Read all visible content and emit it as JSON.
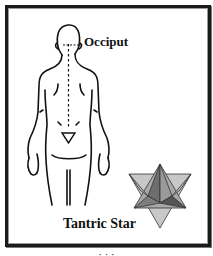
{
  "diagram": {
    "labels": {
      "occiput": "Occiput",
      "star": "Tantric Star"
    },
    "caption": "· · ·",
    "colors": {
      "frame": "#1a1a1a",
      "line": "#111111",
      "star_light": "#c8c8c8",
      "star_mid": "#8f8f8f",
      "star_dark": "#555555"
    }
  }
}
